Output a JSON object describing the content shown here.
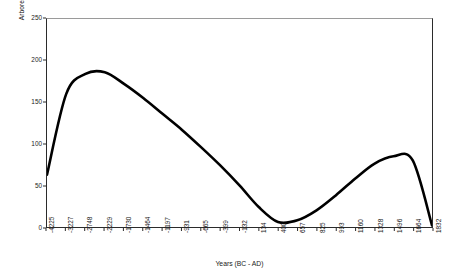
{
  "chart_data": {
    "type": "line",
    "title": "",
    "xlabel": "Years (BC - AD)",
    "ylabel": "Arboreal Pollen Count",
    "ylim": [
      0,
      250
    ],
    "yticks": [
      0,
      50,
      100,
      150,
      200,
      250
    ],
    "ytick_labels": [
      "0",
      "50",
      "100",
      "150",
      "200",
      "250"
    ],
    "grid": false,
    "legend": false,
    "legend_position": "none",
    "line_color": "#000000",
    "categories": [
      "-4225",
      "-3227",
      "-2748",
      "-2229",
      "-1730",
      "-1464",
      "-1197",
      "-931",
      "-665",
      "-399",
      "-132",
      "134",
      "400",
      "657",
      "825",
      "993",
      "1160",
      "1328",
      "1496",
      "1664",
      "1832"
    ],
    "values": [
      63,
      160,
      184,
      186,
      172,
      155,
      136,
      117,
      96,
      74,
      50,
      24,
      6,
      8,
      20,
      38,
      58,
      76,
      85,
      80,
      2
    ],
    "series": [
      {
        "name": "Arboreal Pollen Count",
        "values": [
          63,
          160,
          184,
          186,
          172,
          155,
          136,
          117,
          96,
          74,
          50,
          24,
          6,
          8,
          20,
          38,
          58,
          76,
          85,
          80,
          2
        ]
      }
    ],
    "annotations": []
  },
  "axes": {
    "x_title": "Years (BC - AD)",
    "y_title": "Arboreal Pollen Count"
  },
  "colors": {
    "line": "#000000",
    "frame": "#2b2b2b",
    "text": "#1a1a1a",
    "background": "#ffffff"
  }
}
